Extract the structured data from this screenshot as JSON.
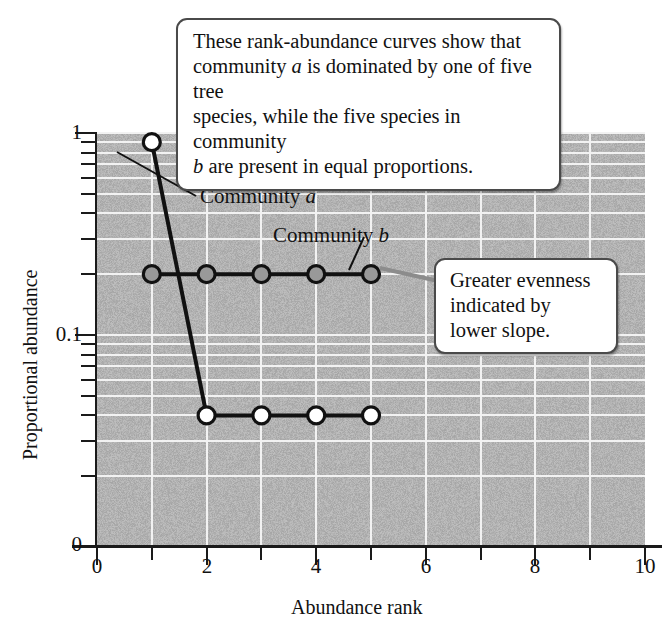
{
  "chart_data": {
    "type": "line",
    "title": "",
    "xlabel": "Abundance rank",
    "ylabel": "Proportional abundance",
    "yscale": "log",
    "xlim": [
      0,
      10
    ],
    "ylim": [
      0.03,
      1.0
    ],
    "grid": true,
    "legend_position": "inline-labels",
    "x_ticks": [
      "0",
      "2",
      "4",
      "6",
      "8",
      "10"
    ],
    "x_tick_values": [
      0,
      2,
      4,
      6,
      8,
      10
    ],
    "y_ticks": [
      "1",
      "0.1",
      "0"
    ],
    "y_tick_values": [
      1,
      0.1,
      0
    ],
    "x": [
      1,
      2,
      3,
      4,
      5
    ],
    "series": [
      {
        "name": "Community a",
        "marker": "open-circle",
        "values": [
          0.9,
          0.04,
          0.04,
          0.04,
          0.04
        ]
      },
      {
        "name": "Community b",
        "marker": "filled-circle",
        "values": [
          0.2,
          0.2,
          0.2,
          0.2,
          0.2
        ]
      }
    ],
    "annotations": [
      "These rank-abundance curves show that community a is dominated by one of five tree species, while the five species in community b are present in equal proportions.",
      "Greater evenness indicated by lower slope."
    ]
  },
  "axes": {
    "y_title": "Proportional abundance",
    "x_title": "Abundance rank",
    "y_labels": {
      "top": "1",
      "mid": "0.1",
      "bottom": "0"
    },
    "x_labels": {
      "t0": "0",
      "t2": "2",
      "t4": "4",
      "t6": "6",
      "t8": "8",
      "t10": "10"
    }
  },
  "curve_labels": {
    "community_a_pre": "Community ",
    "community_a_italic": "a",
    "community_b_pre": "Community ",
    "community_b_italic": "b"
  },
  "callouts": {
    "main": {
      "line1": "These rank-abundance curves show that",
      "line2_pre": "community ",
      "line2_italic": "a",
      "line2_post": " is dominated by one of five tree",
      "line3": "species, while the five species in community",
      "line4_italic": "b",
      "line4_post": " are present in equal proportions."
    },
    "evenness": {
      "line1": "Greater evenness",
      "line2": "indicated by",
      "line3": "lower slope."
    }
  },
  "colors": {
    "plot_background": "#b2b2b2",
    "gridline": "#f2f2f2",
    "axis": "#1a1a1a",
    "series_line": "#111111",
    "marker_open_fill": "#ffffff",
    "marker_filled_fill": "#999999",
    "callout_border": "#4a4a4a",
    "leader_line": "#8c8c8c"
  }
}
